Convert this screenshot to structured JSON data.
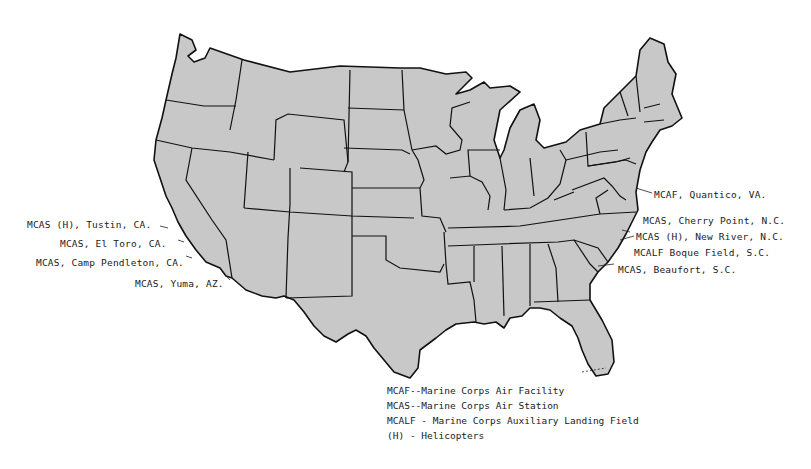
{
  "map": {
    "title": "Marine Corps Air Installations - Continental United States",
    "fill_color": "#c8c8c8",
    "outline_color": "#111111"
  },
  "west_labels": [
    {
      "text": "MCAS (H), Tustin, CA."
    },
    {
      "text": "MCAS, El Toro, CA."
    },
    {
      "text": "MCAS, Camp Pendleton, CA."
    },
    {
      "text": "MCAS, Yuma, AZ."
    }
  ],
  "east_labels": [
    {
      "text": "MCAF, Quantico, VA."
    },
    {
      "text": "MCAS, Cherry Point, N.C."
    },
    {
      "text": "MCAS (H), New River, N.C."
    },
    {
      "text": "MCALF Boque Field, S.C."
    },
    {
      "text": "MCAS, Beaufort, S.C."
    }
  ],
  "legend": [
    {
      "text": "MCAF--Marine Corps Air Facility"
    },
    {
      "text": "MCAS--Marine Corps Air Station"
    },
    {
      "text": "MCALF - Marine Corps Auxiliary Landing Field"
    },
    {
      "text": "(H) - Helicopters"
    }
  ]
}
